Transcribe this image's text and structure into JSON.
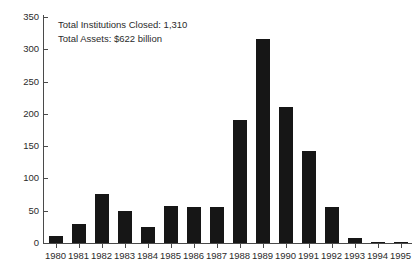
{
  "chart_data": {
    "type": "bar",
    "title": "",
    "xlabel": "",
    "ylabel": "",
    "ylim": [
      0,
      350
    ],
    "ytick_step": 50,
    "yticks": [
      0,
      50,
      100,
      150,
      200,
      250,
      300,
      350
    ],
    "ytick_labels": [
      "0",
      "50",
      "100",
      "150",
      "200",
      "250",
      "300",
      "350"
    ],
    "grid": false,
    "legend": "none",
    "bar_color": "#161616",
    "axis_color": "#4a4a4a",
    "categories": [
      "1980",
      "1981",
      "1982",
      "1983",
      "1984",
      "1985",
      "1986",
      "1987",
      "1988",
      "1989",
      "1990",
      "1991",
      "1992",
      "1993",
      "1994",
      "1995"
    ],
    "values": [
      11,
      29,
      76,
      49,
      25,
      58,
      56,
      56,
      190,
      316,
      211,
      142,
      55,
      7,
      2,
      1
    ],
    "annotations": [
      "Total Institutions Closed: 1,310",
      "Total Assets: $622 billion"
    ]
  }
}
